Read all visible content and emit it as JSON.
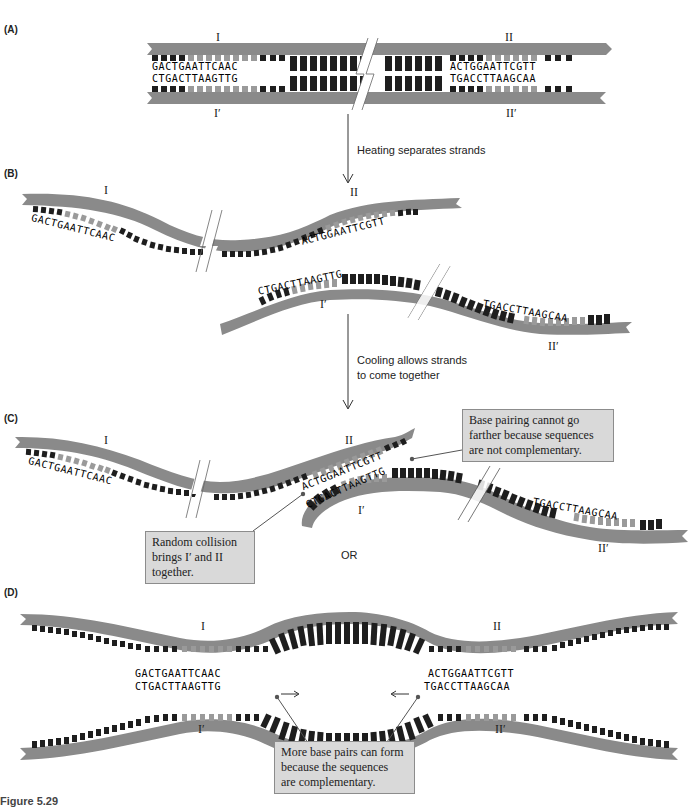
{
  "figure": {
    "caption": "Figure 5.29",
    "colors": {
      "backbone": "#8a8a8a",
      "base_dark": "#1e1e1e",
      "base_light": "#9a9a9a",
      "callout_bg": "#d9d9d9",
      "text": "#222222"
    }
  },
  "panels": {
    "A": {
      "label": "(A)",
      "strand_labels": {
        "top_left": "I",
        "top_right": "II",
        "bottom_left": "I′",
        "bottom_right": "II′"
      },
      "seq_I_top": "GACTGAATTCAAC",
      "seq_I_bottom": "CTGACTTAAGTTG",
      "seq_II_top": "ACTGGAATTCGTT",
      "seq_II_bottom": "TGACCTTAAGCAA"
    },
    "step1": {
      "text": "Heating separates strands"
    },
    "B": {
      "label": "(B)",
      "strand_labels": {
        "I": "I",
        "II": "II",
        "I_prime": "I′",
        "II_prime": "II′"
      },
      "seq_I": "GACTGAATTCAAC",
      "seq_II": "ACTGGAATTCGTT",
      "seq_I_prime": "CTGACTTAAGTTG",
      "seq_II_prime": "TGACCTTAAGCAA"
    },
    "step2": {
      "line1": "Cooling allows strands",
      "line2": "to come together"
    },
    "C": {
      "label": "(C)",
      "strand_labels": {
        "I": "I",
        "II": "II",
        "I_prime": "I′",
        "II_prime": "II′"
      },
      "seq_I": "GACTGAATTCAAC",
      "seq_II": "ACTGGAATTCGTT",
      "seq_I_prime": "CTGACTTAAGTTG",
      "seq_II_prime": "TGACCTTAAGCAA",
      "callout_top": [
        "Base pairing cannot go",
        "farther because sequences",
        "are not complementary."
      ],
      "callout_bottom": [
        "Random collision",
        "brings I′ and II",
        "together."
      ],
      "or_text": "OR"
    },
    "D": {
      "label": "(D)",
      "strand_labels": {
        "I": "I",
        "II": "II",
        "I_prime": "I′",
        "II_prime": "II′"
      },
      "seq_left_top": "GACTGAATTCAAC",
      "seq_left_bottom": "CTGACTTAAGTTG",
      "seq_right_top": "ACTGGAATTCGTT",
      "seq_right_bottom": "TGACCTTAAGCAA",
      "callout": [
        "More base pairs can form",
        "because the sequences",
        "are complementary."
      ]
    }
  }
}
